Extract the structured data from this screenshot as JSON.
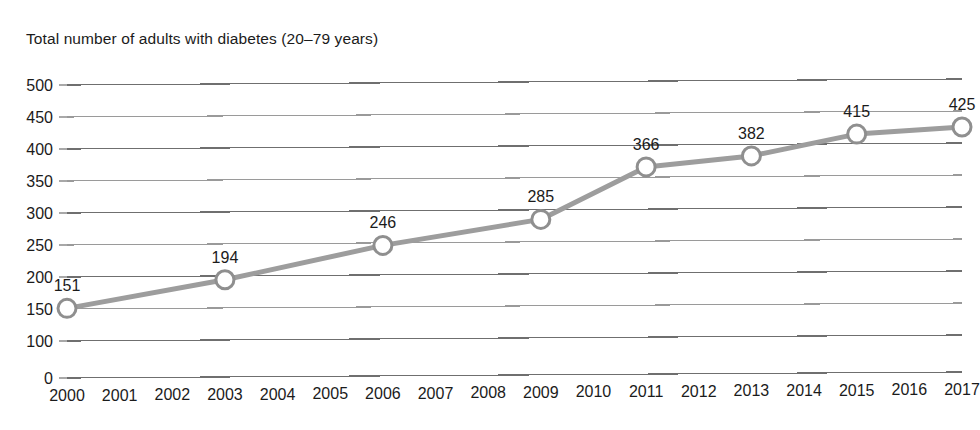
{
  "chart_data": {
    "type": "line",
    "title": "Total number of adults with diabetes (20–79 years)",
    "xlabel": "",
    "ylabel": "",
    "grid": true,
    "legend": "none",
    "xlim": [
      2000,
      2017
    ],
    "ylim": [
      0,
      500
    ],
    "x": [
      2000,
      2001,
      2002,
      2003,
      2004,
      2005,
      2006,
      2007,
      2008,
      2009,
      2010,
      2011,
      2012,
      2013,
      2014,
      2015,
      2016,
      2017
    ],
    "xtick_labels": [
      "2000",
      "2001",
      "2002",
      "2003",
      "2004",
      "2005",
      "2006",
      "2007",
      "2008",
      "2009",
      "2010",
      "2011",
      "2012",
      "2013",
      "2014",
      "2015",
      "2016",
      "2017"
    ],
    "ytick_values": [
      0,
      100,
      150,
      200,
      250,
      300,
      350,
      400,
      450,
      500
    ],
    "ytick_labels": [
      "0",
      "100",
      "150",
      "200",
      "250",
      "300",
      "350",
      "400",
      "450",
      "500"
    ],
    "series": [
      {
        "name": "Total number of adults with diabetes (20-79 years)",
        "marker": "open-circle",
        "color": "#9d9d9d",
        "points": [
          {
            "x": 2000,
            "y": 151,
            "label": "151"
          },
          {
            "x": 2003,
            "y": 194,
            "label": "194"
          },
          {
            "x": 2006,
            "y": 246,
            "label": "246"
          },
          {
            "x": 2009,
            "y": 285,
            "label": "285"
          },
          {
            "x": 2011,
            "y": 366,
            "label": "366"
          },
          {
            "x": 2013,
            "y": 382,
            "label": "382"
          },
          {
            "x": 2015,
            "y": 415,
            "label": "415"
          },
          {
            "x": 2017,
            "y": 425,
            "label": "425"
          }
        ]
      }
    ]
  },
  "colors": {
    "line": "#9d9d9d",
    "marker_fill": "#ffffff",
    "marker_stroke": "#8f8f8f",
    "gridline": "#9a9a9a",
    "text": "#1b1b1b",
    "background": "#ffffff"
  }
}
